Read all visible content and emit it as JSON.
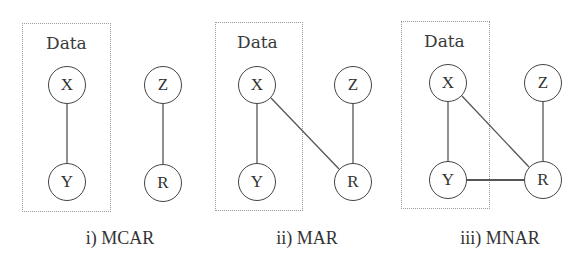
{
  "figure": {
    "type": "missingness-mechanism-diagrams",
    "colors": {
      "edge": "#555555",
      "node_border": "#444444",
      "box_border": "#9a9a9a",
      "text": "#333333"
    },
    "panels": [
      {
        "id": "mcar",
        "caption": "i) MCAR",
        "box_label": "Data",
        "nodes": {
          "X": "X",
          "Y": "Y",
          "Z": "Z",
          "R": "R"
        },
        "edges": [
          [
            "X",
            "Y"
          ],
          [
            "Z",
            "R"
          ]
        ]
      },
      {
        "id": "mar",
        "caption": "ii) MAR",
        "box_label": "Data",
        "nodes": {
          "X": "X",
          "Y": "Y",
          "Z": "Z",
          "R": "R"
        },
        "edges": [
          [
            "X",
            "Y"
          ],
          [
            "X",
            "R"
          ],
          [
            "Z",
            "R"
          ]
        ]
      },
      {
        "id": "mnar",
        "caption": "iii) MNAR",
        "box_label": "Data",
        "nodes": {
          "X": "X",
          "Y": "Y",
          "Z": "Z",
          "R": "R"
        },
        "edges": [
          [
            "X",
            "Y"
          ],
          [
            "X",
            "R"
          ],
          [
            "Z",
            "R"
          ],
          [
            "Y",
            "R"
          ]
        ]
      }
    ]
  }
}
